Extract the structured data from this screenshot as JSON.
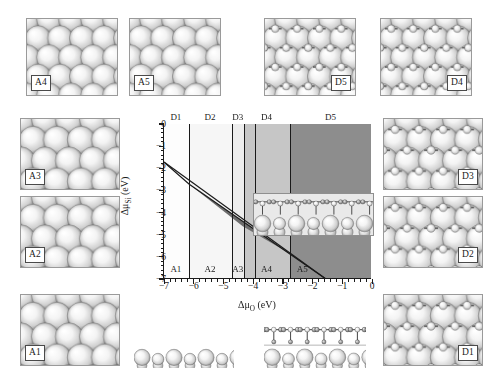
{
  "figure": {
    "type": "surface-phase-diagram-with-structure-panels",
    "background": "#ffffff"
  },
  "chart_data": {
    "type": "line",
    "title": "",
    "xlabel": "Δμ_O (eV)",
    "ylabel": "Δμ_Si (eV)",
    "xlim": [
      -7,
      0
    ],
    "ylim": [
      -7,
      0
    ],
    "xticks": [
      -7,
      -6,
      -5,
      -4,
      -3,
      -2,
      -1,
      0
    ],
    "xticklabels": [
      "−7",
      "−6",
      "−5",
      "−4",
      "−3",
      "−2",
      "−1",
      "0"
    ],
    "yticks": [
      0,
      -1,
      -2,
      -3,
      -4,
      -5,
      -6,
      -7
    ],
    "yticklabels": [
      "0",
      "−1",
      "−2",
      "−3",
      "−4",
      "−5",
      "−6",
      "−7"
    ],
    "minor_ticks": true,
    "grid": false,
    "legend": null,
    "vertical_phase_boundaries_x": [
      -6.15,
      -4.72,
      -4.32,
      -3.95,
      -2.75
    ],
    "phase_regions_top": [
      {
        "label": "D1",
        "x_range": [
          -7.0,
          -6.15
        ],
        "center_x": -6.6,
        "fill": "#fdfdfd"
      },
      {
        "label": "D2",
        "x_range": [
          -6.15,
          -4.72
        ],
        "center_x": -5.45,
        "fill": "#f6f6f6"
      },
      {
        "label": "D3",
        "x_range": [
          -4.72,
          -4.32
        ],
        "center_x": -4.52,
        "fill": "#ededed"
      },
      {
        "label": "D4",
        "x_range": [
          -4.32,
          -2.75
        ],
        "center_x": -3.55,
        "fill": "#c6c6c6"
      },
      {
        "label": "D5",
        "x_range": [
          -2.75,
          0.0
        ],
        "center_x": -1.4,
        "fill": "#8d8d8d"
      }
    ],
    "phase_regions_bottom": [
      {
        "label": "A1",
        "center_x": -6.6
      },
      {
        "label": "A2",
        "center_x": -5.45
      },
      {
        "label": "A3",
        "center_x": -4.52
      },
      {
        "label": "A4",
        "center_x": -3.55
      },
      {
        "label": "A5",
        "center_x": -2.35
      }
    ],
    "boundary_lines": [
      {
        "name": "upper-boundary",
        "points": [
          [
            -7.0,
            -1.72
          ],
          [
            -1.55,
            -7.0
          ]
        ]
      },
      {
        "name": "lower-boundary",
        "points": [
          [
            -7.0,
            -1.72
          ],
          [
            -6.15,
            -2.72
          ],
          [
            -1.55,
            -7.0
          ]
        ]
      }
    ],
    "shaded_wedge": {
      "name": "dark-stability-wedge",
      "fill": "#6e6e6e",
      "points": [
        [
          -6.15,
          -2.72
        ],
        [
          -4.35,
          -4.4
        ],
        [
          -2.7,
          -5.9
        ],
        [
          -4.35,
          -4.62
        ]
      ]
    },
    "inset": {
      "label": "M",
      "description": "side-view slab with adsorbates"
    }
  },
  "panels": [
    {
      "id": "A4",
      "label": "A4",
      "tag_pos": "bl",
      "style": "top-view-spheres",
      "row": "top",
      "col": 1
    },
    {
      "id": "A5",
      "label": "A5",
      "tag_pos": "bl",
      "style": "top-view-spheres",
      "row": "top",
      "col": 2
    },
    {
      "id": "D5",
      "label": "D5",
      "tag_pos": "br",
      "style": "top-view-spheres-adsorbate",
      "row": "top",
      "col": 3
    },
    {
      "id": "D4",
      "label": "D4",
      "tag_pos": "br",
      "style": "top-view-spheres-adsorbate",
      "row": "top",
      "col": 4
    },
    {
      "id": "A3",
      "label": "A3",
      "tag_pos": "bl",
      "style": "top-view-spheres",
      "row": "left",
      "col": 1
    },
    {
      "id": "A2",
      "label": "A2",
      "tag_pos": "bl",
      "style": "top-view-spheres",
      "row": "left",
      "col": 1
    },
    {
      "id": "A1",
      "label": "A1",
      "tag_pos": "bl",
      "style": "top-view-spheres",
      "row": "left",
      "col": 1
    },
    {
      "id": "D3",
      "label": "D3",
      "tag_pos": "br",
      "style": "top-view-spheres-adsorbate",
      "row": "right",
      "col": 1
    },
    {
      "id": "D2",
      "label": "D2",
      "tag_pos": "br",
      "style": "top-view-spheres-adsorbate",
      "row": "right",
      "col": 1
    },
    {
      "id": "D1",
      "label": "D1",
      "tag_pos": "br",
      "style": "top-view-spheres-adsorbate",
      "row": "right",
      "col": 1
    },
    {
      "id": "side-clean",
      "label": "",
      "tag_pos": "none",
      "style": "side-view-clean",
      "row": "bottom",
      "col": 2
    },
    {
      "id": "side-adsorbed",
      "label": "",
      "tag_pos": "none",
      "style": "side-view-adsorbed",
      "row": "bottom",
      "col": 3
    },
    {
      "id": "M",
      "label": "M",
      "tag_pos": "br",
      "style": "side-view-inset",
      "row": "inset",
      "col": 0
    }
  ],
  "colors": {
    "ink": "#1a1a1a",
    "sphere_light": "#ffffff",
    "sphere_mid": "#d8d8d8",
    "sphere_dark": "#787878",
    "panel_bg": "#f2f2f2",
    "panel_border": "#9a9a9a",
    "region_d5": "#8d8d8d",
    "region_d4": "#c6c6c6",
    "region_d3": "#ededed",
    "region_d2": "#f6f6f6",
    "region_d1": "#fdfdfd",
    "wedge": "#6e6e6e"
  }
}
